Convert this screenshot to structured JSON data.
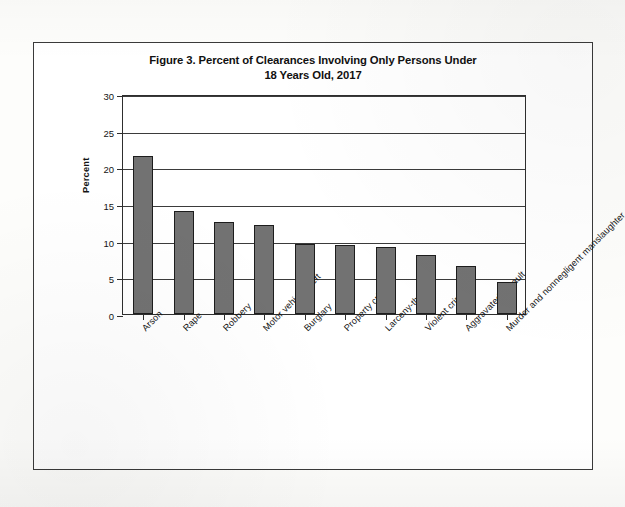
{
  "figure": {
    "title_line1": "Figure 3. Percent of Clearances Involving Only Persons Under",
    "title_line2": "18 Years Old, 2017"
  },
  "chart_data": {
    "type": "bar",
    "title": "Figure 3. Percent of Clearances Involving Only Persons Under 18 Years Old, 2017",
    "xlabel": "",
    "ylabel": "Percent",
    "ylim": [
      0,
      30
    ],
    "yticks": [
      0,
      5,
      10,
      15,
      20,
      25,
      30
    ],
    "grid": true,
    "legend": false,
    "bar_color": "#727272",
    "bar_border_color": "#1d1d1d",
    "categories": [
      "Arson",
      "Rape",
      "Robbery",
      "Motor vehicle theft",
      "Burglary",
      "Property crime",
      "Larceny-theft",
      "Violent crime",
      "Aggravated assault",
      "Murder and nonnegligent manslaughter"
    ],
    "values": [
      21.5,
      14.1,
      12.5,
      12.2,
      9.6,
      9.4,
      9.2,
      8.0,
      6.6,
      4.3
    ]
  }
}
